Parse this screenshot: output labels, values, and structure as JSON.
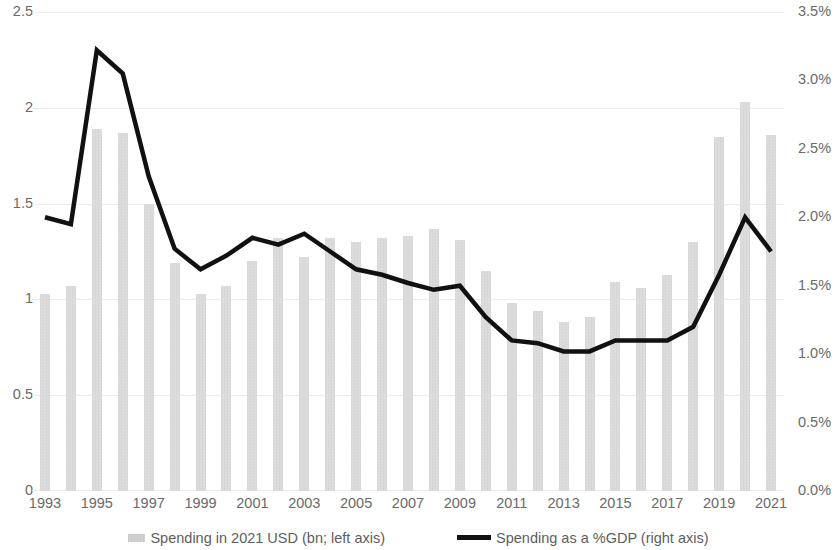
{
  "chart_data": {
    "type": "bar",
    "title": "",
    "subtitle": "",
    "xlabel": "",
    "ylabel": "",
    "grid": true,
    "legend_position": "bottom",
    "categories": [
      "1993",
      "1994",
      "1995",
      "1996",
      "1997",
      "1998",
      "1999",
      "2000",
      "2001",
      "2002",
      "2003",
      "2004",
      "2005",
      "2006",
      "2007",
      "2008",
      "2009",
      "2010",
      "2011",
      "2012",
      "2013",
      "2014",
      "2015",
      "2016",
      "2017",
      "2018",
      "2019",
      "2020",
      "2021"
    ],
    "x_tick_labels": [
      "1993",
      "1995",
      "1997",
      "1999",
      "2001",
      "2003",
      "2005",
      "2007",
      "2009",
      "2011",
      "2013",
      "2015",
      "2017",
      "2019",
      "2021"
    ],
    "left_axis": {
      "label": "Spending in 2021 USD (bn)",
      "ticks": [
        "0",
        "0.5",
        "1",
        "1.5",
        "2",
        "2.5"
      ],
      "tick_values": [
        0,
        0.5,
        1,
        1.5,
        2,
        2.5
      ],
      "ylim": [
        0,
        2.5
      ]
    },
    "right_axis": {
      "label": "Spending as a %GDP",
      "ticks": [
        "0.0%",
        "0.5%",
        "1.0%",
        "1.5%",
        "2.0%",
        "2.5%",
        "3.0%",
        "3.5%"
      ],
      "tick_values": [
        0,
        0.5,
        1.0,
        1.5,
        2.0,
        2.5,
        3.0,
        3.5
      ],
      "ylim": [
        0,
        3.5
      ]
    },
    "series": [
      {
        "name": "Spending in 2021 USD (bn; left axis)",
        "type": "bar",
        "axis": "left",
        "color": "#d6d6d6",
        "values": [
          1.03,
          1.07,
          1.89,
          1.87,
          1.5,
          1.19,
          1.03,
          1.07,
          1.2,
          1.32,
          1.22,
          1.32,
          1.3,
          1.32,
          1.33,
          1.37,
          1.31,
          1.15,
          0.98,
          0.94,
          0.88,
          0.91,
          1.09,
          1.06,
          1.13,
          1.3,
          1.85,
          2.03,
          1.86
        ]
      },
      {
        "name": "Spending as a %GDP (right axis)",
        "type": "line",
        "axis": "right",
        "color": "#111111",
        "values": [
          2.0,
          1.95,
          3.22,
          3.05,
          2.3,
          1.77,
          1.62,
          1.72,
          1.85,
          1.8,
          1.88,
          1.75,
          1.62,
          1.58,
          1.52,
          1.47,
          1.5,
          1.27,
          1.1,
          1.08,
          1.02,
          1.02,
          1.1,
          1.1,
          1.1,
          1.2,
          1.58,
          2.0,
          1.75
        ]
      }
    ]
  },
  "legend": {
    "items": [
      {
        "label": "Spending in 2021 USD (bn; left axis)",
        "marker": "bar-swatch"
      },
      {
        "label": "Spending as a %GDP (right axis)",
        "marker": "line-swatch"
      }
    ]
  }
}
